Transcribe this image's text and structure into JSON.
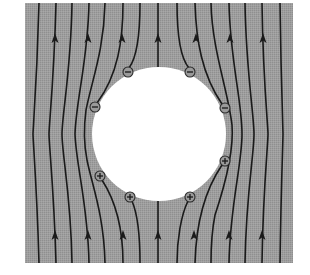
{
  "figure": {
    "description": "Electric field lines around a conducting sphere in a uniform upward field with induced surface charges",
    "colors": {
      "background_field": "#9c9c9c",
      "conductor": "#ffffff",
      "field_line": "#1a1a1a",
      "page": "#ffffff"
    },
    "field_region": {
      "x": 25,
      "y": 3,
      "width": 268,
      "height": 260
    },
    "conductor": {
      "cx": 159,
      "cy": 134,
      "r": 67
    },
    "field_direction": "up",
    "charges": [
      {
        "sign": "-",
        "x": 128,
        "y": 72
      },
      {
        "sign": "-",
        "x": 190,
        "y": 72
      },
      {
        "sign": "-",
        "x": 95,
        "y": 107
      },
      {
        "sign": "-",
        "x": 225,
        "y": 108
      },
      {
        "sign": "+",
        "x": 100,
        "y": 176
      },
      {
        "sign": "+",
        "x": 225,
        "y": 161
      },
      {
        "sign": "+",
        "x": 130,
        "y": 197
      },
      {
        "sign": "+",
        "x": 190,
        "y": 197
      }
    ],
    "labels": {
      "negative_sign": "−",
      "positive_sign": "+"
    }
  }
}
